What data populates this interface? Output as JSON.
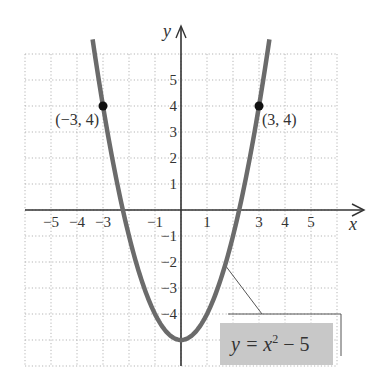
{
  "chart_data": {
    "type": "line",
    "title": "",
    "xlabel": "x",
    "ylabel": "y",
    "xlim": [
      -6,
      6
    ],
    "ylim": [
      -6,
      6
    ],
    "grid": true,
    "x_ticks": [
      -5,
      -4,
      -3,
      -1,
      1,
      3,
      4,
      5
    ],
    "x_tick_labels": [
      "−5",
      "−4",
      "−3",
      "−1",
      "1",
      "3",
      "4",
      "5"
    ],
    "y_ticks": [
      5,
      4,
      3,
      2,
      1,
      -1,
      -2,
      -3,
      -4
    ],
    "y_tick_labels": [
      "5",
      "4",
      "3",
      "2",
      "1",
      "−1",
      "−2",
      "−3",
      "−4"
    ],
    "series": [
      {
        "name": "y = x^2 − 5",
        "function": "x^2 - 5",
        "x_range": [
          -3.4,
          3.4
        ],
        "color": "#6b6b6b"
      }
    ],
    "points": [
      {
        "x": -3,
        "y": 4,
        "label": "(−3, 4)"
      },
      {
        "x": 3,
        "y": 4,
        "label": "(3, 4)"
      }
    ],
    "annotations": [
      {
        "text_main": "y = x",
        "text_sup": "2",
        "text_tail": " − 5",
        "points_to": {
          "x": 1.7,
          "y": -2.1
        },
        "box_fill": "#c8c8c8"
      }
    ]
  },
  "layout": {
    "origin_px": [
      181,
      210
    ],
    "unit_px": 26
  }
}
